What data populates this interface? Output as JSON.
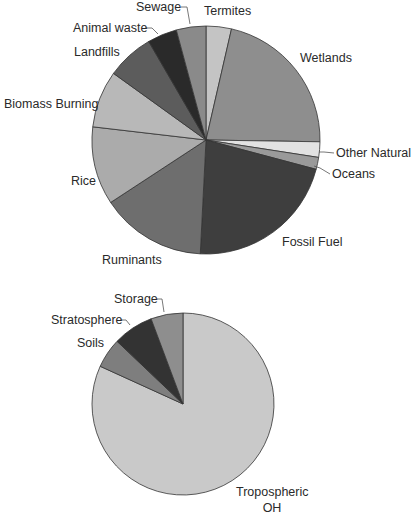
{
  "chart_data": [
    {
      "type": "pie",
      "title": "",
      "name": "methane-sources",
      "center": [
        206,
        140
      ],
      "radius": 114,
      "start_angle_deg": 0,
      "direction": "clockwise",
      "slices": [
        {
          "label": "Termites",
          "value": 3.6,
          "color": "#c4c4c4"
        },
        {
          "label": "Wetlands",
          "value": 21.7,
          "color": "#8e8e8e"
        },
        {
          "label": "Other Natural",
          "value": 2.2,
          "color": "#e2e2e2"
        },
        {
          "label": "Oceans",
          "value": 1.7,
          "color": "#9a9a9a"
        },
        {
          "label": "Fossil  Fuel",
          "value": 21.7,
          "color": "#3e3e3e"
        },
        {
          "label": "Ruminants",
          "value": 15.0,
          "color": "#6e6e6e"
        },
        {
          "label": "Rice",
          "value": 11.1,
          "color": "#ababab"
        },
        {
          "label": "Biomass Burning",
          "value": 8.1,
          "color": "#b8b8b8"
        },
        {
          "label": "Landfills",
          "value": 6.7,
          "color": "#5c5c5c"
        },
        {
          "label": "Animal waste",
          "value": 4.2,
          "color": "#2a2a2a"
        },
        {
          "label": "Sewage",
          "value": 4.2,
          "color": "#8a8a8a"
        }
      ],
      "labels": [
        {
          "text": "Sewage",
          "x": 136,
          "y": 11,
          "anchor": "start",
          "leader": [
            [
              181,
              7
            ],
            [
              187,
              7
            ],
            [
              190,
              24
            ]
          ]
        },
        {
          "text": "Termites",
          "x": 204,
          "y": 15,
          "anchor": "start"
        },
        {
          "text": "Animal waste",
          "x": 73,
          "y": 32,
          "anchor": "start",
          "leader": [
            [
              145,
              28
            ],
            [
              152,
              28
            ],
            [
              158,
              34
            ]
          ]
        },
        {
          "text": "Wetlands",
          "x": 300,
          "y": 62,
          "anchor": "start"
        },
        {
          "text": "Landfills",
          "x": 74,
          "y": 56,
          "anchor": "start"
        },
        {
          "text": "Biomass Burning",
          "x": 4,
          "y": 108,
          "anchor": "start"
        },
        {
          "text": "Other Natural",
          "x": 336,
          "y": 157,
          "anchor": "start",
          "leader": [
            [
              319,
              152
            ],
            [
              324,
              152
            ],
            [
              334,
              153
            ]
          ]
        },
        {
          "text": "Oceans",
          "x": 332,
          "y": 178,
          "anchor": "start",
          "leader": [
            [
              314,
              166
            ],
            [
              320,
              168
            ],
            [
              330,
              174
            ]
          ]
        },
        {
          "text": "Rice",
          "x": 71,
          "y": 185,
          "anchor": "start"
        },
        {
          "text": "Fossil  Fuel",
          "x": 282,
          "y": 246,
          "anchor": "start"
        },
        {
          "text": "Ruminants",
          "x": 102,
          "y": 264,
          "anchor": "start"
        }
      ],
      "xlabel": "",
      "ylabel": ""
    },
    {
      "type": "pie",
      "title": "",
      "name": "methane-sinks",
      "center": [
        183,
        404
      ],
      "radius": 91,
      "start_angle_deg": 0,
      "direction": "clockwise",
      "slices": [
        {
          "label": "Tropospheric OH",
          "value": 81.8,
          "color": "#c9c9c9"
        },
        {
          "label": "Soils",
          "value": 5.3,
          "color": "#7e7e7e"
        },
        {
          "label": "Stratosphere",
          "value": 7.2,
          "color": "#333333"
        },
        {
          "label": "Storage",
          "value": 5.7,
          "color": "#8e8e8e"
        }
      ],
      "labels": [
        {
          "text": "Storage",
          "x": 114,
          "y": 303,
          "anchor": "start",
          "leader": [
            [
              157,
              299
            ],
            [
              162,
              299
            ],
            [
              164,
              312
            ]
          ]
        },
        {
          "text": "Stratosphere",
          "x": 51,
          "y": 324,
          "anchor": "start",
          "leader": [
            [
              120,
              320
            ],
            [
              126,
              320
            ],
            [
              130,
              325
            ]
          ]
        },
        {
          "text": "Soils",
          "x": 77,
          "y": 347,
          "anchor": "start"
        },
        {
          "text": "Tropospheric",
          "x": 236,
          "y": 496,
          "anchor": "start"
        },
        {
          "text": "OH",
          "x": 272,
          "y": 512,
          "anchor": "middle"
        }
      ],
      "xlabel": "",
      "ylabel": ""
    }
  ]
}
